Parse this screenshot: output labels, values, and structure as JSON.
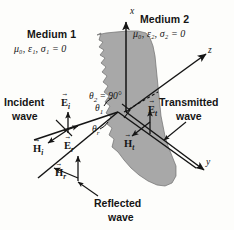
{
  "figure": {
    "background_color": "#fdfdfb",
    "interface_fill": "#a8a8a8",
    "line_color": "#151515"
  },
  "media": {
    "left": {
      "name": "Medium 1",
      "params": "μ₀, ε₁, σ₁ = 0"
    },
    "right": {
      "name": "Medium 2",
      "params": "μ₀, ε₂, σ₂ = 0"
    }
  },
  "axes": [
    {
      "name": "x-axis",
      "label": "x"
    },
    {
      "name": "y-axis",
      "label": "y"
    },
    {
      "name": "z-axis",
      "label": "z"
    }
  ],
  "waves": {
    "incident": {
      "line1": "Incident",
      "line2": "wave"
    },
    "reflected": {
      "line1": "Reflected",
      "line2": "wave"
    },
    "transmitted": {
      "line1": "Transmitted",
      "line2": "wave"
    }
  },
  "vectors": [
    {
      "name": "E-incident",
      "symbol": "E",
      "sub": "i"
    },
    {
      "name": "H-incident",
      "symbol": "H",
      "sub": "i"
    },
    {
      "name": "E-reflected",
      "symbol": "E",
      "sub": "r"
    },
    {
      "name": "H-reflected",
      "symbol": "H",
      "sub": "r"
    },
    {
      "name": "E-transmitted",
      "symbol": "E",
      "sub": "t"
    },
    {
      "name": "H-transmitted",
      "symbol": "H",
      "sub": "t"
    }
  ],
  "angles": {
    "theta2": {
      "symbol": "θ",
      "sub": "2",
      "value": "= 90°"
    },
    "theta1": {
      "symbol": "θ",
      "sub": "1"
    },
    "thetar": {
      "symbol": "θ",
      "sub": "r"
    }
  },
  "vector_glyphs": {
    "E_i": "E",
    "H_i": "H",
    "E_r": "E",
    "H_r": "H",
    "E_t": "E",
    "H_t": "H"
  },
  "subscripts": {
    "i": "i",
    "r": "r",
    "t": "t"
  }
}
